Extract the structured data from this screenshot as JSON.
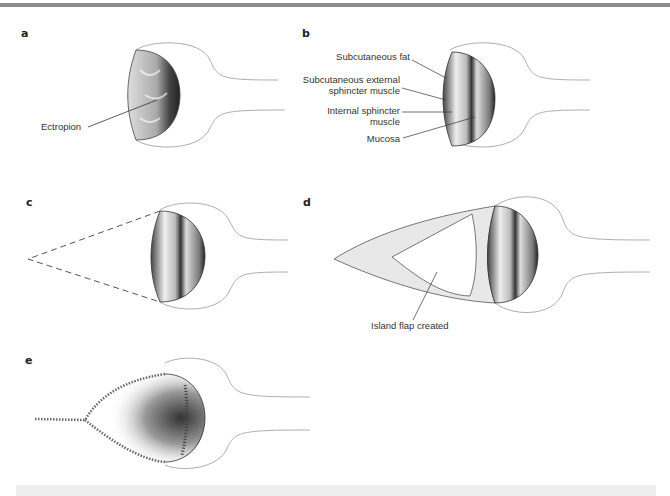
{
  "figure": {
    "panels": [
      {
        "id": "a",
        "letter": "a",
        "labels": [
          "Ectropion"
        ]
      },
      {
        "id": "b",
        "letter": "b",
        "labels": [
          "Subcutaneous fat",
          "Subcutaneous external",
          "sphincter muscle",
          "Internal sphincter",
          "muscle",
          "Mucosa"
        ]
      },
      {
        "id": "c",
        "letter": "c",
        "labels": []
      },
      {
        "id": "d",
        "letter": "d",
        "labels": [
          "Island flap created"
        ]
      },
      {
        "id": "e",
        "letter": "e",
        "labels": []
      }
    ]
  },
  "colors": {
    "topbar": "#8c8c8c",
    "ink": "#333333",
    "mucosa_dark": "#2a2a2a",
    "skin_line": "#9a9a9a"
  }
}
